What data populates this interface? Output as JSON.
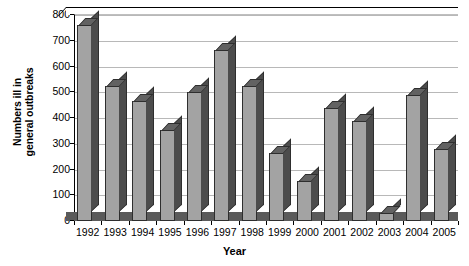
{
  "chart_data": {
    "type": "bar",
    "title": "",
    "subtitle": "",
    "xlabel": "Year",
    "ylabel": "Numbers ill in general outbreaks",
    "ylabel_line1": "Numbers ill in",
    "ylabel_line2": "general outbreaks",
    "categories": [
      "1992",
      "1993",
      "1994",
      "1995",
      "1996",
      "1997",
      "1998",
      "1999",
      "2000",
      "2001",
      "2002",
      "2003",
      "2004",
      "2005"
    ],
    "values": [
      760,
      525,
      465,
      355,
      500,
      665,
      525,
      265,
      155,
      440,
      390,
      30,
      490,
      280
    ],
    "series": [
      {
        "name": "Numbers ill in general outbreaks",
        "values": [
          760,
          525,
          465,
          355,
          500,
          665,
          525,
          265,
          155,
          440,
          390,
          30,
          490,
          280
        ]
      }
    ],
    "ylim": [
      0,
      800
    ],
    "ytick_step": 100,
    "yticks": [
      "800",
      "700",
      "600",
      "500",
      "400",
      "300",
      "200",
      "100",
      "0"
    ],
    "ytick_values": [
      800,
      700,
      600,
      500,
      400,
      300,
      200,
      100,
      0
    ],
    "grid": true,
    "grid_axis": "y",
    "legend": false,
    "legend_position": "none",
    "style": "3d-column",
    "colors": {
      "bar_face": "#a3a3a3",
      "bar_side": "#4c4c4c",
      "bar_top": "#626262",
      "bar_outline": "#2e2e2e",
      "gridline": "#b8b8b8",
      "axis": "#000000",
      "floor": "#5a5a5a",
      "plot_background": "#ffffff"
    }
  }
}
